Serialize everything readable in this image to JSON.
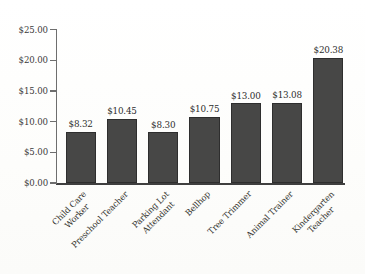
{
  "chart_data": {
    "type": "bar",
    "title": "",
    "subtitle": "",
    "xlabel": "",
    "ylabel": "",
    "grid": false,
    "legend": "none",
    "ylim": [
      0,
      25
    ],
    "ytick_step": 5,
    "ytick_labels": [
      "$25.00",
      "$20.00",
      "$15.00",
      "$10.00",
      "$5.00",
      "$0.00"
    ],
    "ytick_values": [
      25,
      20,
      15,
      10,
      5,
      0
    ],
    "categories": [
      "Child Care Worker",
      "Preschool Teacher",
      "Parking Lot Attendant",
      "Bellhop",
      "Tree Trimmer",
      "Animal Trainer",
      "Kindergarten Teacher"
    ],
    "category_lines": [
      [
        "Child Care",
        "Worker"
      ],
      [
        "Preschool Teacher"
      ],
      [
        "Parking Lot",
        "Attendant"
      ],
      [
        "Bellhop"
      ],
      [
        "Tree Trimmer"
      ],
      [
        "Animal Trainer"
      ],
      [
        "Kindergarten",
        "Teacher"
      ]
    ],
    "values": [
      8.32,
      10.45,
      8.3,
      10.75,
      13.0,
      13.08,
      20.38
    ],
    "value_labels": [
      "$8.32",
      "$10.45",
      "$8.30",
      "$10.75",
      "$13.00",
      "$13.08",
      "$20.38"
    ],
    "colors": {
      "bar_fill": "#474746",
      "bar_stroke": "#2e2e2e",
      "axis": "#3f3f3f",
      "tick": "#6e6e6e",
      "text": "#2d2d2d",
      "background": "#fdfdfc"
    }
  }
}
